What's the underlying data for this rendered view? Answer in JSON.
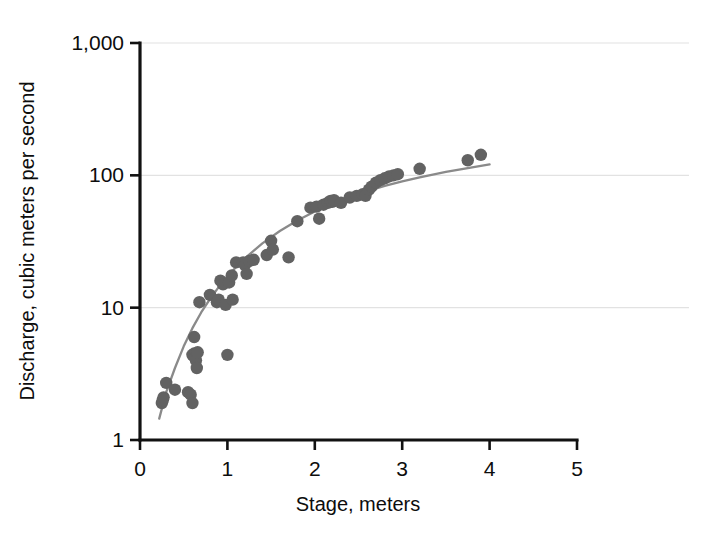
{
  "chart_data": {
    "type": "scatter",
    "title": "",
    "subtitle": "",
    "xlabel": "Stage, meters",
    "ylabel": "Discharge, cubic meters per second",
    "xscale": "linear",
    "yscale": "log",
    "xlim": [
      0,
      5
    ],
    "ylim": [
      1,
      1000
    ],
    "grid": true,
    "legend": null,
    "legend_position": "none",
    "xticks": [
      0,
      1,
      2,
      3,
      4,
      5
    ],
    "xticklabels": [
      "0",
      "1",
      "2",
      "3",
      "4",
      "5"
    ],
    "yticks": [
      1,
      10,
      100,
      1000
    ],
    "yticklabels": [
      "1",
      "10",
      "100",
      "1,000"
    ],
    "marker": "circle",
    "marker_color": "#626262",
    "line_color": "#8a8a8a",
    "series": [
      {
        "name": "Measured discharge",
        "type": "scatter",
        "x": [
          0.25,
          0.26,
          0.27,
          0.3,
          0.4,
          0.55,
          0.58,
          0.6,
          0.6,
          0.62,
          0.62,
          0.63,
          0.64,
          0.65,
          0.66,
          0.68,
          0.8,
          0.88,
          0.9,
          0.92,
          0.95,
          0.98,
          1.0,
          1.02,
          1.05,
          1.06,
          1.1,
          1.18,
          1.2,
          1.22,
          1.25,
          1.3,
          1.45,
          1.5,
          1.52,
          1.7,
          1.8,
          1.95,
          2.02,
          2.05,
          2.1,
          2.15,
          2.18,
          2.2,
          2.22,
          2.3,
          2.4,
          2.48,
          2.55,
          2.58,
          2.62,
          2.65,
          2.7,
          2.75,
          2.8,
          2.85,
          2.9,
          2.95,
          3.2,
          3.75,
          3.9
        ],
        "y": [
          1.9,
          2.0,
          2.1,
          2.7,
          2.4,
          2.3,
          2.2,
          1.9,
          4.4,
          6.0,
          4.5,
          4.2,
          4.0,
          3.5,
          4.6,
          11.0,
          12.5,
          11.0,
          11.5,
          16.0,
          15.0,
          10.5,
          4.4,
          15.5,
          17.5,
          11.5,
          22.0,
          22.0,
          21.0,
          18.0,
          22.5,
          23.0,
          25.0,
          32.0,
          27.5,
          24.0,
          45.0,
          57.0,
          58.0,
          47.0,
          60.0,
          62.0,
          64.0,
          63.0,
          65.0,
          62.0,
          68.0,
          70.0,
          72.0,
          70.0,
          78.0,
          82.0,
          88.0,
          92.0,
          95.0,
          98.0,
          100.0,
          102.0,
          112.0,
          130.0,
          143.0
        ]
      },
      {
        "name": "Fitted rating curve",
        "type": "line",
        "x": [
          0.22,
          0.3,
          0.4,
          0.5,
          0.6,
          0.7,
          0.8,
          0.9,
          1.0,
          1.1,
          1.2,
          1.4,
          1.6,
          1.8,
          2.0,
          2.2,
          2.4,
          2.6,
          2.8,
          3.0,
          3.2,
          3.5,
          3.8,
          4.0
        ],
        "y": [
          1.45,
          2.3,
          3.5,
          5.1,
          7.0,
          9.2,
          11.6,
          14.3,
          17.2,
          20.3,
          23.6,
          30.6,
          38.0,
          45.6,
          53.3,
          61.0,
          68.6,
          76.0,
          83.2,
          90.0,
          96.6,
          106.0,
          115.0,
          121.0
        ]
      }
    ]
  },
  "axes": {
    "x_title": "Stage, meters",
    "y_title": "Discharge, cubic meters per second"
  }
}
